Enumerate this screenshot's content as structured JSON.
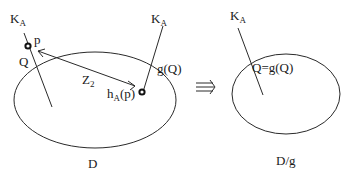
{
  "left_panel": {
    "region_label": "D",
    "ka_top_left": {
      "main": "K",
      "sub": "A"
    },
    "point_p": "p",
    "point_q": "Q",
    "arrow_label": {
      "main": "Z",
      "sub": "2"
    },
    "point_ha": {
      "main": "h",
      "sub": "A",
      "tail": "(p)"
    },
    "ka_middle": {
      "main": "K",
      "sub": "A"
    },
    "point_gq": "g(Q)"
  },
  "implies_symbol": "⇛",
  "right_panel": {
    "region_label": "D/g",
    "ka": {
      "main": "K",
      "sub": "A"
    },
    "fixed_point": "Q=g(Q)"
  }
}
